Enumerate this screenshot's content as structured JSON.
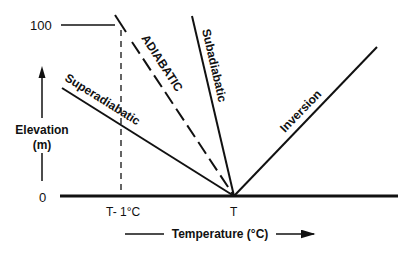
{
  "diagram": {
    "y_axis": {
      "label_line1": "Elevation",
      "label_line2": "(m)",
      "ticks": [
        "100",
        "0"
      ]
    },
    "x_axis": {
      "label": "Temperature (°C)",
      "ticks": [
        "T- 1°C",
        "T"
      ]
    },
    "lines": [
      {
        "name": "Superadiabatic",
        "style": "solid"
      },
      {
        "name": "ADIABATIC",
        "style": "dashed"
      },
      {
        "name": "Subadiabatic",
        "style": "solid"
      },
      {
        "name": "Inversion",
        "style": "solid"
      }
    ],
    "colors": {
      "ink": "#111111",
      "background": "#ffffff"
    }
  }
}
